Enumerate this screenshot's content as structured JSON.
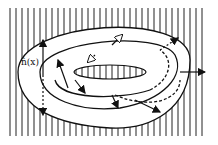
{
  "figure": {
    "label_normal": "n̂(x)",
    "background": "vertical hatching",
    "colors": {
      "ink": "#111111",
      "paper": "#ffffff"
    }
  }
}
